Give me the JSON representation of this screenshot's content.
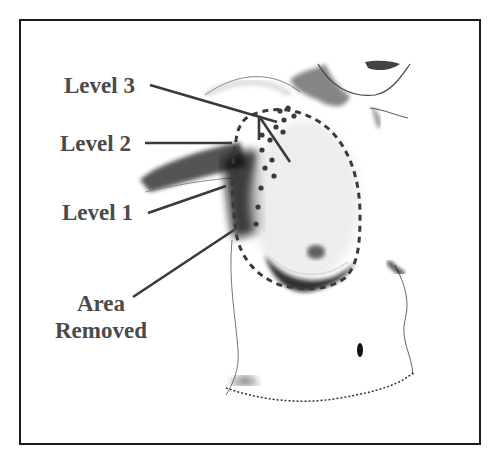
{
  "diagram": {
    "labels": {
      "level3": "Level 3",
      "level2": "Level 2",
      "level1": "Level 1",
      "area_line1": "Area",
      "area_line2": "Removed"
    },
    "colors": {
      "label_text": "#4a4a4a",
      "leader_lines": "#3a3a3a",
      "frame": "#1a1a1a",
      "shading": "#111111"
    }
  }
}
